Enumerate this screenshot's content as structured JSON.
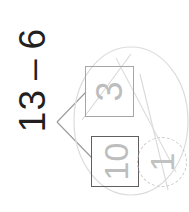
{
  "page": {
    "width": 189,
    "height": 212,
    "background": "#ffffff"
  },
  "expression": {
    "minuend": "13",
    "operator": "–",
    "subtrahend": "6",
    "full_text": "13 – 6",
    "color": "#231f20",
    "rotation_degrees": -90
  },
  "number_bond": {
    "vertex_label": "",
    "branches": [
      {
        "name": "branch-to-top-box",
        "target": "box-top"
      },
      {
        "name": "branch-to-bottom-box",
        "target": "box-bottom"
      }
    ],
    "boxes": [
      {
        "id": "box-top",
        "value": "3",
        "border_color": "#a6a6a6",
        "text_color": "#bdbdbd"
      },
      {
        "id": "box-bottom",
        "value": "10",
        "border_color": "#5f5f5f",
        "text_color": "#bdbdbd"
      }
    ]
  },
  "answer": {
    "value": "1",
    "circle_style": "dashed",
    "circle_color": "#c9c9c9",
    "text_color": "#c2c2c2"
  },
  "annotations": {
    "overlay_circle_color": "#dcdcdc",
    "diagonal_line_color": "#d6d6d6",
    "bond_line_color": "#9a9a9a"
  }
}
